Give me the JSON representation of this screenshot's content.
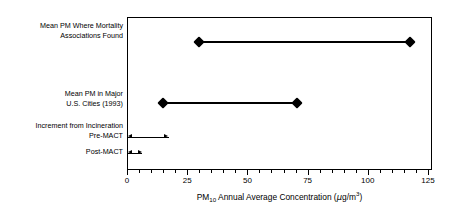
{
  "chart_data": {
    "type": "bar",
    "title": "",
    "subtitle": "",
    "xlabel": "PM10 Annual Average Concentration (µg/m3)",
    "ylabel": "",
    "xlim": [
      0,
      125
    ],
    "xticks": [
      0,
      25,
      50,
      75,
      100,
      125
    ],
    "xticklabels": [
      "0",
      "25",
      "50",
      "75",
      "100",
      "125"
    ],
    "minor_tick_interval": 5,
    "grid": false,
    "legend": false,
    "orientation": "horizontal",
    "categories": [
      "Mean PM Where Mortality Associations Found",
      "Mean PM in Major U.S. Cities (1993)",
      "Increment from Incineration Pre-MACT",
      "Post-MACT"
    ],
    "series": [
      {
        "name": "Mean PM Where Mortality Associations Found",
        "style": "diamond-endpoints",
        "start": 29.5,
        "end": 117,
        "marker": "diamond"
      },
      {
        "name": "Mean PM in Major U.S. Cities (1993)",
        "style": "diamond-endpoints",
        "start": 14.5,
        "end": 70,
        "marker": "diamond"
      },
      {
        "name": "Increment from Incineration Pre-MACT",
        "style": "double-arrow",
        "start": 0,
        "end": 17,
        "marker": "arrow"
      },
      {
        "name": "Post-MACT",
        "style": "double-arrow",
        "start": 0,
        "end": 6,
        "marker": "arrow"
      }
    ]
  },
  "axis": {
    "title_prefix": "PM",
    "title_sub": "10",
    "title_mid": " Annual Average Concentration (",
    "title_mu": "µ",
    "title_unit": "g/m",
    "title_sup": "3",
    "title_close": ")",
    "ticks": [
      {
        "value": "0",
        "label": "0"
      },
      {
        "value": "25",
        "label": "25"
      },
      {
        "value": "50",
        "label": "50"
      },
      {
        "value": "75",
        "label": "75"
      },
      {
        "value": "100",
        "label": "100"
      },
      {
        "value": "125",
        "label": "125"
      }
    ]
  },
  "labels": {
    "mortality_line1": "Mean PM Where Mortality",
    "mortality_line2": "Associations Found",
    "cities_line1": "Mean PM in Major",
    "cities_line2": "U.S. Cities (1993)",
    "increment": "Increment from Incineration",
    "premact": "Pre-MACT",
    "postmact": "Post-MACT"
  }
}
